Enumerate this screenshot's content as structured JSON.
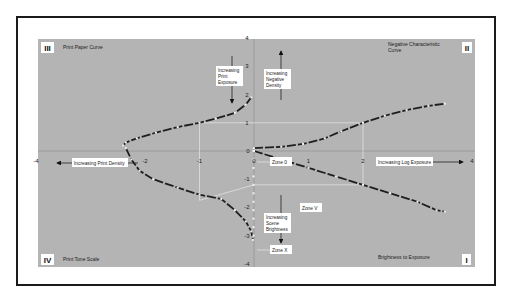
{
  "chart_data": {
    "type": "line",
    "axes": {
      "x_range": [
        -4,
        4
      ],
      "y_range": [
        -4,
        4
      ],
      "x_ticks": [
        -4,
        -2,
        -1,
        0,
        1,
        2,
        4
      ],
      "y_ticks": [
        4,
        3,
        2,
        1,
        0,
        -1,
        -2,
        -3,
        -4
      ],
      "grid": false
    },
    "quadrants": [
      {
        "id": "I",
        "numeral": "I",
        "title": "Brightness to Exposure"
      },
      {
        "id": "II",
        "numeral": "II",
        "title": "Negative Characteristic Curve"
      },
      {
        "id": "III",
        "numeral": "III",
        "title": "Print Paper Curve"
      },
      {
        "id": "IV",
        "numeral": "IV",
        "title": "Print Tone Scale"
      }
    ],
    "series": [
      {
        "name": "Brightness to Exposure (Quadrant I)",
        "points": [
          [
            0,
            0
          ],
          [
            0.5,
            -0.3
          ],
          [
            1,
            -0.6
          ],
          [
            1.5,
            -0.9
          ],
          [
            2,
            -1.2
          ],
          [
            2.5,
            -1.5
          ],
          [
            3,
            -1.8
          ],
          [
            3.35,
            -2.1
          ],
          [
            3.5,
            -2.15
          ]
        ]
      },
      {
        "name": "Negative Characteristic Curve (Quadrant II)",
        "points": [
          [
            0,
            0.1
          ],
          [
            0.5,
            0.15
          ],
          [
            0.9,
            0.25
          ],
          [
            1.3,
            0.45
          ],
          [
            1.6,
            0.7
          ],
          [
            2,
            1.0
          ],
          [
            2.4,
            1.25
          ],
          [
            2.8,
            1.45
          ],
          [
            3.2,
            1.6
          ],
          [
            3.5,
            1.68
          ]
        ]
      },
      {
        "name": "Print Paper Curve (Quadrant III)",
        "points": [
          [
            -0.05,
            1.9
          ],
          [
            -0.15,
            1.65
          ],
          [
            -0.35,
            1.35
          ],
          [
            -0.7,
            1.15
          ],
          [
            -1,
            1.0
          ],
          [
            -1.4,
            0.85
          ],
          [
            -1.8,
            0.65
          ],
          [
            -2.15,
            0.45
          ],
          [
            -2.35,
            0.3
          ],
          [
            -2.4,
            0.2
          ]
        ]
      },
      {
        "name": "Print Tone Scale (Quadrant IV)",
        "points": [
          [
            -2.35,
            0.1
          ],
          [
            -2.25,
            -0.3
          ],
          [
            -2.1,
            -0.7
          ],
          [
            -1.85,
            -1.0
          ],
          [
            -1.4,
            -1.3
          ],
          [
            -1,
            -1.55
          ],
          [
            -0.6,
            -1.7
          ],
          [
            -0.35,
            -2.1
          ],
          [
            -0.15,
            -2.5
          ],
          [
            -0.05,
            -2.85
          ],
          [
            -0.02,
            -3.15
          ]
        ]
      }
    ],
    "guide_lines": [
      {
        "from": [
          2,
          -1.2
        ],
        "to": [
          2,
          1.0
        ]
      },
      {
        "from": [
          2,
          1.0
        ],
        "to": [
          -1,
          1.0
        ]
      },
      {
        "from": [
          -1,
          1.0
        ],
        "to": [
          -1,
          -1.75
        ]
      },
      {
        "from": [
          2,
          -1.2
        ],
        "to": [
          0,
          -1.2
        ]
      },
      {
        "from": [
          0,
          -1.2
        ],
        "to": [
          -1,
          -1.75
        ]
      }
    ],
    "zone_points": [
      0,
      -0.3,
      -0.6,
      -0.9,
      -1.2,
      -1.5,
      -1.8,
      -2.1,
      -2.4,
      -2.7,
      -3.0
    ]
  },
  "labels": {
    "increasing_print_exposure": [
      "Increasing",
      "Print",
      "Exposure"
    ],
    "increasing_negative_density": [
      "Increasing",
      "Negative",
      "Density"
    ],
    "increasing_print_density": "Increasing Print Density",
    "increasing_log_exposure": "Increasing Log Exposure",
    "increasing_scene_brightness": [
      "Increasing",
      "Scene",
      "Brightness"
    ],
    "zone_0": "Zone 0",
    "zone_v": "Zone V",
    "zone_x": "Zone X"
  },
  "colors": {
    "background": "#ffffff",
    "plot_area": "#b4b4b4",
    "frame": "#1a1a1a",
    "curve": "#1e1e1e",
    "curve_marker": "#f2f2f2",
    "guide": "#e6e6e6",
    "axis": "#9a9a9a"
  }
}
